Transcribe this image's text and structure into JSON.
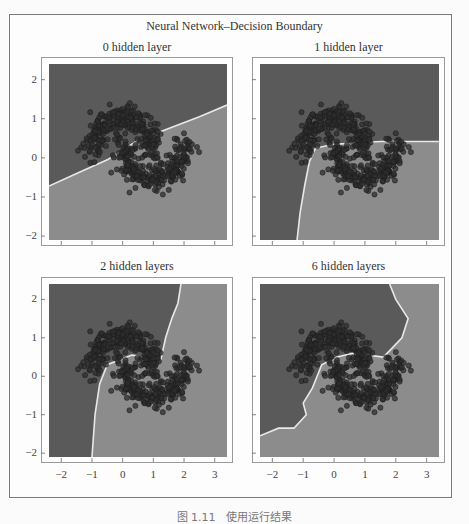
{
  "figure": {
    "title": "Neural Network–Decision Boundary",
    "caption": "图 1.11　使用运行结果"
  },
  "colors": {
    "region_dark": "#5a5a5a",
    "region_light": "#8c8c8c",
    "boundary": "#e8e8e8",
    "points": "#2e2e2e",
    "point_edge": "#1a1a1a",
    "frame": "#7a7a7a"
  },
  "chart_data": [
    {
      "type": "scatter",
      "title": "0 hidden layer",
      "xlim": [
        -2.4,
        3.4
      ],
      "ylim": [
        -2.1,
        2.4
      ],
      "xticks": [
        "-2",
        "-1",
        "0",
        "1",
        "2",
        "3"
      ],
      "yticks": [
        "2",
        "1",
        "0",
        "-1",
        "-2"
      ],
      "show_x_tick_labels": false,
      "show_y_tick_labels": true,
      "boundary": [
        [
          -2.4,
          -0.72
        ],
        [
          -1.5,
          -0.4
        ],
        [
          -0.5,
          -0.05
        ],
        [
          0.5,
          0.45
        ],
        [
          1.5,
          0.75
        ],
        [
          2.5,
          1.05
        ],
        [
          3.4,
          1.35
        ]
      ],
      "dataset": "two interleaving half-moons (noisy)"
    },
    {
      "type": "scatter",
      "title": "1 hidden layer",
      "xlim": [
        -2.4,
        3.4
      ],
      "ylim": [
        -2.1,
        2.4
      ],
      "xticks": [
        "-2",
        "-1",
        "0",
        "1",
        "2",
        "3"
      ],
      "yticks": [
        "2",
        "1",
        "0",
        "-1",
        "-2"
      ],
      "show_x_tick_labels": false,
      "show_y_tick_labels": false,
      "boundary": [
        [
          -1.2,
          -2.1
        ],
        [
          -1.1,
          -1.4
        ],
        [
          -0.95,
          -0.7
        ],
        [
          -0.8,
          -0.1
        ],
        [
          -0.6,
          0.25
        ],
        [
          0.0,
          0.35
        ],
        [
          1.5,
          0.42
        ],
        [
          3.4,
          0.42
        ]
      ],
      "dataset": "two interleaving half-moons (noisy)"
    },
    {
      "type": "scatter",
      "title": "2 hidden layers",
      "xlim": [
        -2.4,
        3.4
      ],
      "ylim": [
        -2.1,
        2.4
      ],
      "xticks": [
        "-2",
        "-1",
        "0",
        "1",
        "2",
        "3"
      ],
      "yticks": [
        "2",
        "1",
        "0",
        "-1",
        "-2"
      ],
      "show_x_tick_labels": true,
      "show_y_tick_labels": true,
      "boundary": [
        [
          -1.0,
          -2.1
        ],
        [
          -0.9,
          -1.0
        ],
        [
          -0.75,
          -0.2
        ],
        [
          -0.5,
          0.3
        ],
        [
          0.3,
          0.55
        ],
        [
          1.25,
          0.45
        ],
        [
          1.4,
          1.0
        ],
        [
          1.6,
          1.5
        ],
        [
          1.8,
          1.9
        ],
        [
          1.9,
          2.4
        ]
      ],
      "dataset": "two interleaving half-moons (noisy)"
    },
    {
      "type": "scatter",
      "title": "6 hidden layers",
      "xlim": [
        -2.4,
        3.4
      ],
      "ylim": [
        -2.1,
        2.4
      ],
      "xticks": [
        "-2",
        "-1",
        "0",
        "1",
        "2",
        "3"
      ],
      "yticks": [
        "2",
        "1",
        "0",
        "-1",
        "-2"
      ],
      "show_x_tick_labels": true,
      "show_y_tick_labels": false,
      "boundary": [
        [
          -2.4,
          -1.55
        ],
        [
          -1.8,
          -1.35
        ],
        [
          -1.3,
          -1.35
        ],
        [
          -0.9,
          -1.0
        ],
        [
          -1.0,
          -0.7
        ],
        [
          -0.7,
          -0.3
        ],
        [
          -0.4,
          0.3
        ],
        [
          0.1,
          0.5
        ],
        [
          0.6,
          0.6
        ],
        [
          1.6,
          0.5
        ],
        [
          2.2,
          1.0
        ],
        [
          2.4,
          1.5
        ],
        [
          2.0,
          2.0
        ],
        [
          1.8,
          2.4
        ]
      ],
      "dataset": "two interleaving half-moons (noisy)"
    }
  ],
  "xtick_labels": [
    "-2",
    "-1",
    "0",
    "1",
    "2",
    "3"
  ],
  "ytick_labels": [
    "2",
    "1",
    "0",
    "-1",
    "-2"
  ]
}
